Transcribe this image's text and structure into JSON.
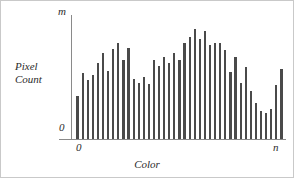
{
  "figure": {
    "background_color": "#ffffff",
    "border_color": "#c9c9c9",
    "axis_color": "#8a8a8a",
    "bar_color": "#4a4a4a",
    "text_color": "#2b2b2b"
  },
  "labels": {
    "y_axis_title_line1": "Pixel",
    "y_axis_title_line2": "Count",
    "y_axis_max": "m",
    "y_axis_min": "0",
    "x_axis_title": "Color",
    "x_axis_min": "0",
    "x_axis_max": "n"
  },
  "chart_data": {
    "type": "bar",
    "title": "",
    "subtitle": "",
    "xlabel": "Color",
    "ylabel": "Pixel Count",
    "grid": false,
    "legend": "none",
    "xlim": [
      0,
      41
    ],
    "ylim": [
      0,
      100
    ],
    "ytick_labels": [
      "0",
      "m"
    ],
    "ytick_values": [
      0,
      100
    ],
    "xtick_labels": [
      "0",
      "n"
    ],
    "xtick_values": [
      0,
      41
    ],
    "annotations": [],
    "categories": [
      "0",
      "1",
      "2",
      "3",
      "4",
      "5",
      "6",
      "7",
      "8",
      "9",
      "10",
      "11",
      "12",
      "13",
      "14",
      "15",
      "16",
      "17",
      "18",
      "19",
      "20",
      "21",
      "22",
      "23",
      "24",
      "25",
      "26",
      "27",
      "28",
      "29",
      "30",
      "31",
      "32",
      "33",
      "34",
      "35",
      "36",
      "37",
      "38",
      "39",
      "40"
    ],
    "values": [
      36,
      55,
      49,
      53,
      63,
      72,
      57,
      75,
      80,
      66,
      76,
      50,
      47,
      52,
      46,
      66,
      61,
      68,
      63,
      72,
      66,
      80,
      85,
      92,
      83,
      90,
      78,
      80,
      80,
      74,
      56,
      68,
      47,
      60,
      40,
      30,
      23,
      22,
      25,
      45,
      58
    ]
  }
}
